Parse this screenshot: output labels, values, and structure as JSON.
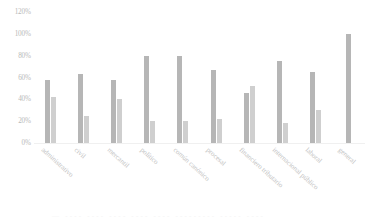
{
  "chart_data": {
    "type": "bar",
    "title": "",
    "subtitle": "",
    "xlabel": "",
    "ylabel": "",
    "ylim": [
      0,
      120
    ],
    "y_tick_labels": [
      "120%",
      "100%",
      "80%",
      "60%",
      "40%",
      "20%",
      "0%"
    ],
    "y_tick_values": [
      120,
      100,
      80,
      60,
      40,
      20,
      0
    ],
    "grid": false,
    "legend_position": "none",
    "categories": [
      "administrativo",
      "civil",
      "mercantil",
      "político",
      "común canónico",
      "procesal",
      "financiero tributario",
      "internacional público",
      "laboral",
      "general"
    ],
    "series": [
      {
        "name": "serie-1",
        "color": "#b6b6b6",
        "values": [
          58,
          63,
          58,
          80,
          80,
          67,
          46,
          75,
          65,
          100
        ]
      },
      {
        "name": "serie-2",
        "color": "#cfcfcf",
        "values": [
          42,
          25,
          40,
          20,
          20,
          22,
          52,
          18,
          30,
          null
        ]
      }
    ]
  },
  "footer": {
    "cut_off_text": "— ---- ---- ---- ---- ---- --------- ----- ----"
  }
}
